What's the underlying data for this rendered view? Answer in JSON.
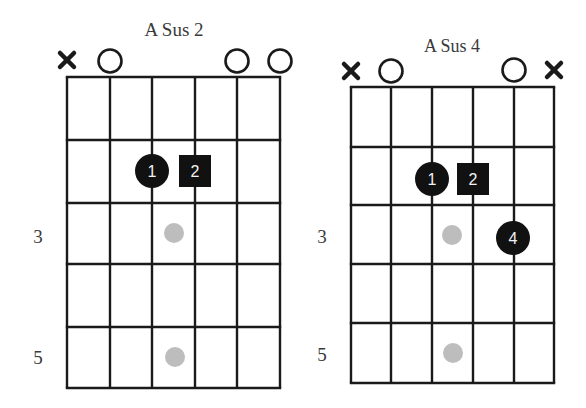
{
  "colors": {
    "grid": "#1a1a1a",
    "finger_fill": "#111111",
    "finger_text": "#f2f2f2",
    "ghost_dot": "#bdbdbd",
    "title": "#3a3a3a"
  },
  "diagrams": [
    {
      "id": "a-sus-2",
      "title": "A Sus 2",
      "title_pos": {
        "x": 174,
        "y": 36,
        "size": 19
      },
      "grid": {
        "x": [
          67,
          110,
          152,
          195,
          237,
          280
        ],
        "y": [
          77,
          140,
          203,
          264,
          327,
          388
        ]
      },
      "string_markers": [
        {
          "string": 0,
          "type": "muted",
          "label": "x",
          "y": 60
        },
        {
          "string": 1,
          "type": "open",
          "label": "o",
          "y": 61
        },
        {
          "string": 4,
          "type": "open",
          "label": "o",
          "y": 61
        },
        {
          "string": 5,
          "type": "open",
          "label": "o",
          "y": 61
        }
      ],
      "fingers": [
        {
          "finger": "1",
          "shape": "circle",
          "string": 2,
          "fret": 2,
          "cx": 152,
          "cy": 171
        },
        {
          "finger": "2",
          "shape": "square",
          "string": 3,
          "fret": 2,
          "cx": 195,
          "cy": 171
        }
      ],
      "position_dots": [
        {
          "fret": 3,
          "cx": 174,
          "cy": 233
        },
        {
          "fret": 5,
          "cx": 175,
          "cy": 357
        }
      ],
      "fret_labels": [
        {
          "text": "3",
          "x": 38,
          "y": 243
        },
        {
          "text": "5",
          "x": 38,
          "y": 364
        }
      ]
    },
    {
      "id": "a-sus-4",
      "title": "A Sus 4",
      "title_pos": {
        "x": 452,
        "y": 52,
        "size": 18
      },
      "grid": {
        "x": [
          351,
          391,
          432,
          473,
          514,
          554
        ],
        "y": [
          87,
          147,
          205,
          264,
          323,
          383
        ]
      },
      "string_markers": [
        {
          "string": 0,
          "type": "muted",
          "label": "x",
          "y": 71
        },
        {
          "string": 1,
          "type": "open",
          "label": "o",
          "y": 71
        },
        {
          "string": 4,
          "type": "open",
          "label": "o",
          "y": 70
        },
        {
          "string": 5,
          "type": "muted",
          "label": "x",
          "y": 70
        }
      ],
      "fingers": [
        {
          "finger": "1",
          "shape": "circle",
          "string": 2,
          "fret": 2,
          "cx": 432,
          "cy": 179
        },
        {
          "finger": "2",
          "shape": "square",
          "string": 3,
          "fret": 2,
          "cx": 473,
          "cy": 179
        },
        {
          "finger": "4",
          "shape": "circle",
          "string": 4,
          "fret": 3,
          "cx": 513,
          "cy": 238
        }
      ],
      "position_dots": [
        {
          "fret": 3,
          "cx": 452,
          "cy": 235
        },
        {
          "fret": 5,
          "cx": 453,
          "cy": 353
        }
      ],
      "fret_labels": [
        {
          "text": "3",
          "x": 322,
          "y": 243
        },
        {
          "text": "5",
          "x": 322,
          "y": 361
        }
      ]
    }
  ]
}
